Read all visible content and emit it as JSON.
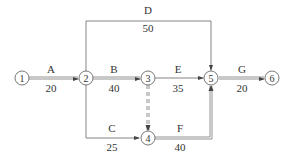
{
  "diagram": {
    "type": "activity-on-arrow network",
    "nodes": [
      {
        "id": "1",
        "label": "1"
      },
      {
        "id": "2",
        "label": "2"
      },
      {
        "id": "3",
        "label": "3"
      },
      {
        "id": "4",
        "label": "4"
      },
      {
        "id": "5",
        "label": "5"
      },
      {
        "id": "6",
        "label": "6"
      }
    ],
    "activities": [
      {
        "name": "A",
        "duration": "20",
        "from": "1",
        "to": "2",
        "critical": true
      },
      {
        "name": "B",
        "duration": "40",
        "from": "2",
        "to": "3",
        "critical": true
      },
      {
        "name": "C",
        "duration": "25",
        "from": "2",
        "to": "4",
        "critical": false
      },
      {
        "name": "D",
        "duration": "50",
        "from": "2",
        "to": "5",
        "critical": false
      },
      {
        "name": "E",
        "duration": "35",
        "from": "3",
        "to": "5",
        "critical": false
      },
      {
        "name": "F",
        "duration": "40",
        "from": "4",
        "to": "5",
        "critical": true
      },
      {
        "name": "G",
        "duration": "20",
        "from": "5",
        "to": "6",
        "critical": true
      }
    ],
    "dummies": [
      {
        "from": "3",
        "to": "4",
        "style": "dashed",
        "critical": true
      }
    ],
    "colors": {
      "line": "#555555",
      "text": "#333333"
    }
  }
}
